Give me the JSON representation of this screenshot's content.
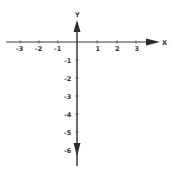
{
  "diagram": {
    "type": "coordinate-plane",
    "x_axis": {
      "label": "X",
      "ticks": [
        {
          "value": -3,
          "label": "-3"
        },
        {
          "value": -2,
          "label": "-2"
        },
        {
          "value": -1,
          "label": "-1"
        },
        {
          "value": 1,
          "label": "1"
        },
        {
          "value": 2,
          "label": "2"
        },
        {
          "value": 3,
          "label": "3"
        }
      ]
    },
    "y_axis": {
      "label": "Y",
      "ticks": [
        {
          "value": -1,
          "label": "-1"
        },
        {
          "value": -2,
          "label": "-2"
        },
        {
          "value": -3,
          "label": "-3"
        },
        {
          "value": -4,
          "label": "-4"
        },
        {
          "value": -5,
          "label": "-5"
        },
        {
          "value": -6,
          "label": "-6"
        }
      ]
    },
    "colors": {
      "axis": "#3a3a3a",
      "text": "#333333",
      "background": "#ffffff"
    }
  }
}
